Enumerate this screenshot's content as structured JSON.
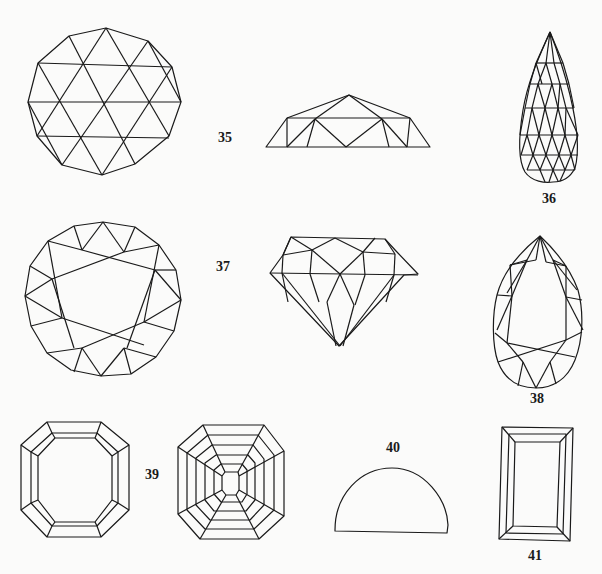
{
  "figure": {
    "labels": {
      "fig35": "35",
      "fig36": "36",
      "fig37": "37",
      "fig38": "38",
      "fig39": "39",
      "fig40": "40",
      "fig41": "41"
    },
    "items": [
      {
        "id": "35",
        "description": "Rose cut (top and side views)"
      },
      {
        "id": "36",
        "description": "Briolette cut"
      },
      {
        "id": "37",
        "description": "Brilliant cut (top and side views)"
      },
      {
        "id": "38",
        "description": "Pear cut"
      },
      {
        "id": "39",
        "description": "Emerald/step cut and scissor cut (top views)"
      },
      {
        "id": "40",
        "description": "Cabochon (side view)"
      },
      {
        "id": "41",
        "description": "Baguette / rectangular step cut"
      }
    ],
    "line_color": "#1a1a1a",
    "background": "#fbfbfa"
  }
}
